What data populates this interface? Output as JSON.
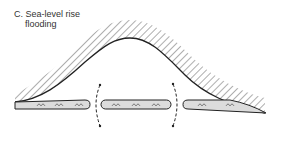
{
  "diagram": {
    "label_letter": "C.",
    "label_line1": "Sea-level rise",
    "label_line2": "flooding",
    "colors": {
      "line": "#222222",
      "island_fill": "#dcdcdc",
      "background": "#ffffff"
    },
    "islands_count": 3,
    "breach_arrows_count": 2
  }
}
